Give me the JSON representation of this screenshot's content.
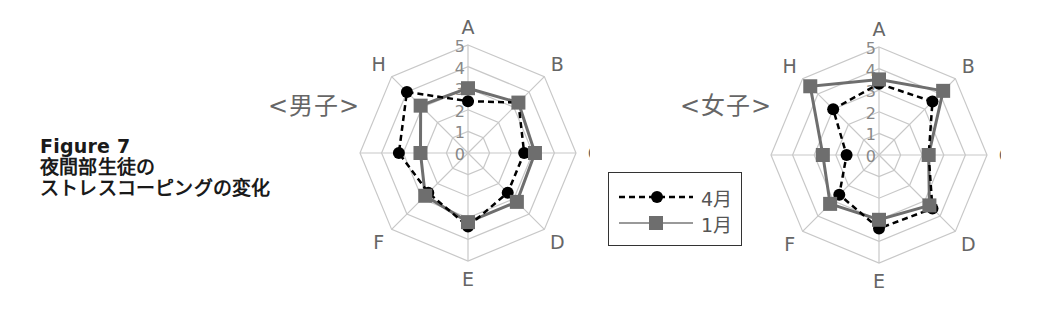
{
  "figure": {
    "title_line1": "Figure 7",
    "title_line2": "夜間部生徒の",
    "title_line3": "ストレスコーピングの変化"
  },
  "legend": {
    "items": [
      {
        "label": "4月",
        "style": "dashed",
        "marker": "circle",
        "color": "#000000"
      },
      {
        "label": "1月",
        "style": "solid",
        "marker": "square",
        "color": "#6e6e6e"
      }
    ]
  },
  "colors": {
    "grid": "#c8c8c8",
    "series_april": "#000000",
    "series_january": "#6e6e6e",
    "axis_text": "#666666"
  },
  "chart_data": [
    {
      "type": "radar",
      "title": "<男子>",
      "categories": [
        "A",
        "B",
        "C",
        "D",
        "E",
        "F",
        "G",
        "H"
      ],
      "ticks": [
        "0",
        "1",
        "2",
        "3",
        "4",
        "5"
      ],
      "range": [
        0,
        5
      ],
      "grid": true,
      "legend_position": "between charts",
      "series": [
        {
          "name": "4月",
          "values": [
            2.4,
            3.3,
            2.6,
            2.6,
            3.4,
            2.6,
            3.2,
            4.0
          ]
        },
        {
          "name": "1月",
          "values": [
            3.0,
            3.3,
            3.1,
            3.2,
            3.2,
            2.8,
            2.2,
            3.1
          ]
        }
      ]
    },
    {
      "type": "radar",
      "title": "<女子>",
      "categories": [
        "A",
        "B",
        "C",
        "D",
        "E",
        "F",
        "G",
        "H"
      ],
      "ticks": [
        "0",
        "1",
        "2",
        "3",
        "4",
        "5"
      ],
      "range": [
        0,
        5
      ],
      "grid": true,
      "legend_position": "between charts",
      "series": [
        {
          "name": "4月",
          "values": [
            3.3,
            3.5,
            2.3,
            3.5,
            3.4,
            2.6,
            1.5,
            3.0
          ]
        },
        {
          "name": "1月",
          "values": [
            3.5,
            4.2,
            2.3,
            3.3,
            3.0,
            3.2,
            2.6,
            4.5
          ]
        }
      ]
    }
  ]
}
